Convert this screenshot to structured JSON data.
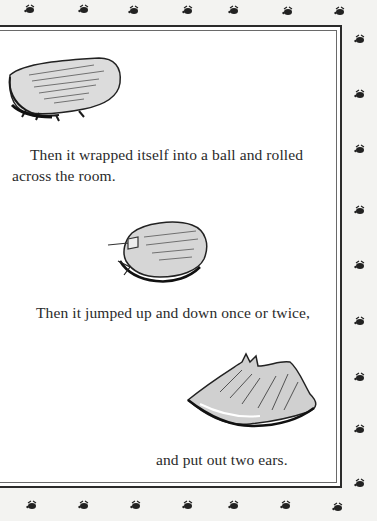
{
  "page": {
    "paragraphs": [
      {
        "line1": "Then it wrapped itself into a ball and rolled",
        "line2": "across the room."
      },
      {
        "line1": "Then it jumped up and down once or twice,"
      },
      {
        "line1": "and put out two ears."
      }
    ],
    "illustrations": [
      {
        "name": "crumpled-cloth-creature",
        "description": "crumpled cloth lying flat"
      },
      {
        "name": "rolled-ball-creature",
        "description": "cloth wrapped into a ball"
      },
      {
        "name": "creature-with-ears",
        "description": "cloth creature with two ears"
      }
    ],
    "border": {
      "ornament": "bee-icon",
      "outer_color": "#2b2b2b",
      "inner_color": "#6a6a6a",
      "background": "#f3f3f1"
    }
  }
}
